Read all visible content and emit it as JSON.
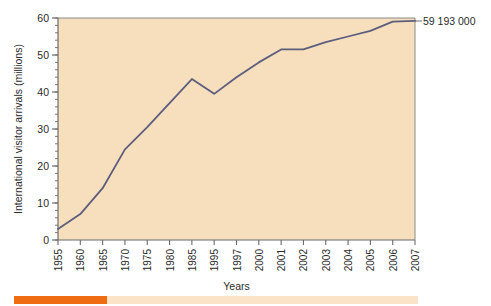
{
  "chart_data": {
    "type": "line",
    "title": "",
    "xlabel": "Years",
    "ylabel": "International visitor arrivals (millions)",
    "categories": [
      "1955",
      "1960",
      "1965",
      "1970",
      "1975",
      "1980",
      "1985",
      "1995",
      "1997",
      "2000",
      "2001",
      "2002",
      "2003",
      "2004",
      "2005",
      "2006",
      "2007"
    ],
    "values": [
      3,
      7,
      14,
      24.5,
      30.5,
      37,
      43.5,
      39.5,
      44,
      48,
      51.5,
      51.5,
      53.5,
      55,
      56.5,
      59,
      59.2
    ],
    "series": [
      {
        "name": "International visitor arrivals",
        "values": [
          3,
          7,
          14,
          24.5,
          30.5,
          37,
          43.5,
          39.5,
          44,
          48,
          51.5,
          51.5,
          53.5,
          55,
          56.5,
          59,
          59.2
        ]
      }
    ],
    "ylim": [
      0,
      60
    ],
    "ytick_labels": [
      "0",
      "10",
      "20",
      "30",
      "40",
      "50",
      "60"
    ],
    "ytick_values": [
      0,
      10,
      20,
      30,
      40,
      50,
      60
    ],
    "yminor_step": 2,
    "grid": false,
    "legend": "none",
    "annotations": [
      {
        "name": "final-value",
        "text": "59 193 000",
        "category": "2007",
        "value": 59.193
      }
    ],
    "colors": {
      "plot_background": "#f7dfbe",
      "line": "#5d5d7d",
      "axis": "#6b6b6b",
      "text": "#2b2b2b",
      "figure_background": "#ffffff"
    }
  },
  "progress": {
    "name": "progress-bar",
    "fill_color": "#ef6c12",
    "track_color": "#fbe3c8",
    "percent": 23
  }
}
